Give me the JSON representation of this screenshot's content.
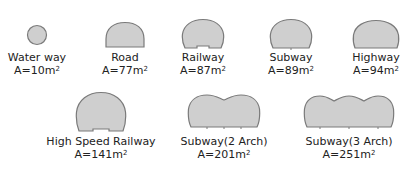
{
  "colors": {
    "fill": "#cfcfcf",
    "stroke": "#7a7a7a",
    "text": "#222222"
  },
  "sections": [
    {
      "name": "Water way",
      "area_prefix": "A=10m",
      "area_unit_sup": "2",
      "shape": "circle"
    },
    {
      "name": "Road",
      "area_prefix": "A=77m",
      "area_unit_sup": "2",
      "shape": "arch"
    },
    {
      "name": "Railway",
      "area_prefix": "A=87m",
      "area_unit_sup": "2",
      "shape": "arch"
    },
    {
      "name": "Subway",
      "area_prefix": "A=89m",
      "area_unit_sup": "2",
      "shape": "arch"
    },
    {
      "name": "Highway",
      "area_prefix": "A=94m",
      "area_unit_sup": "2",
      "shape": "arch"
    },
    {
      "name": "High Speed Railway",
      "area_prefix": "A=141m",
      "area_unit_sup": "2",
      "shape": "arch"
    },
    {
      "name": "Subway(2 Arch)",
      "area_prefix": "A=201m",
      "area_unit_sup": "2",
      "shape": "double-arch"
    },
    {
      "name": "Subway(3 Arch)",
      "area_prefix": "A=251m",
      "area_unit_sup": "2",
      "shape": "triple-arch"
    }
  ]
}
